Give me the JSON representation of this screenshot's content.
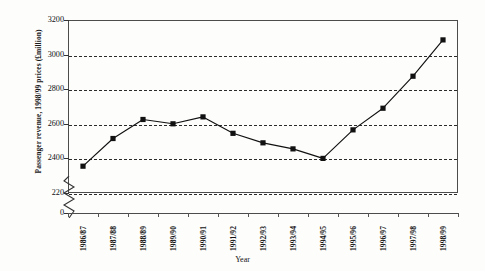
{
  "chart_data": {
    "type": "line",
    "title": "",
    "xlabel": "Year",
    "ylabel": "Passenger revenue, 1998/99 prices (£million)",
    "categories": [
      "1986/87",
      "1987/88",
      "1988/89",
      "1989/90",
      "1990/91",
      "1991/92",
      "1992/93",
      "1993/94",
      "1994/95",
      "1995/96",
      "1996/97",
      "1997/98",
      "1998/99"
    ],
    "values": [
      2355,
      2515,
      2625,
      2600,
      2640,
      2545,
      2490,
      2455,
      2400,
      2565,
      2690,
      2875,
      3085
    ],
    "series": [
      {
        "name": "Passenger revenue",
        "values": [
          2355,
          2515,
          2625,
          2600,
          2640,
          2545,
          2490,
          2455,
          2400,
          2565,
          2690,
          2875,
          3085
        ]
      }
    ],
    "ylim": [
      2200,
      3200
    ],
    "ytick_labels": [
      "3200",
      "3000",
      "2800",
      "2600",
      "2400",
      "220"
    ],
    "ytick_values": [
      3200,
      3000,
      2800,
      2600,
      2400,
      2200
    ],
    "gridline_values": [
      3000,
      2800,
      2600,
      2400,
      2200
    ],
    "axis_break": true,
    "zero_label": "0",
    "grid": true,
    "legend": "none",
    "marker": "filled-square",
    "line_color": "#111111",
    "marker_color": "#111111",
    "grid_color": "#2b2b2b",
    "frame_color": "#4c4c4c",
    "background": "#fdfdfc"
  }
}
